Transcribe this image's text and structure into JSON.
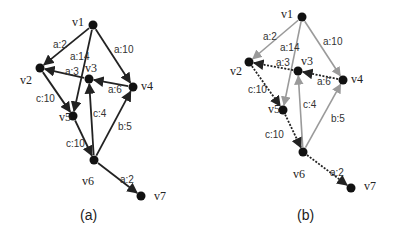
{
  "panels": [
    {
      "caption": "(a)",
      "nodes": [
        {
          "id": "v1",
          "x": 93,
          "y": 25,
          "lx": 72,
          "ly": 26
        },
        {
          "id": "v2",
          "x": 40,
          "y": 68,
          "lx": 20,
          "ly": 84
        },
        {
          "id": "v3",
          "x": 89,
          "y": 79,
          "lx": 85,
          "ly": 72
        },
        {
          "id": "v4",
          "x": 133,
          "y": 87,
          "lx": 141,
          "ly": 90
        },
        {
          "id": "v5",
          "x": 73,
          "y": 116,
          "lx": 59,
          "ly": 121
        },
        {
          "id": "v6",
          "x": 94,
          "y": 160,
          "lx": 82,
          "ly": 185
        },
        {
          "id": "v7",
          "x": 141,
          "y": 196,
          "lx": 154,
          "ly": 200
        }
      ],
      "edges": [
        {
          "from": "v1",
          "to": "v2",
          "label": "a:2",
          "lx": 53,
          "ly": 48,
          "style": "solid"
        },
        {
          "from": "v1",
          "to": "v5",
          "label": "a:14",
          "lx": 70,
          "ly": 60,
          "style": "solid"
        },
        {
          "from": "v1",
          "to": "v4",
          "label": "a:10",
          "lx": 114,
          "ly": 53,
          "style": "solid"
        },
        {
          "from": "v3",
          "to": "v2",
          "label": "a:3",
          "lx": 65,
          "ly": 75,
          "style": "solid"
        },
        {
          "from": "v4",
          "to": "v3",
          "label": "a:6",
          "lx": 108,
          "ly": 93,
          "style": "solid"
        },
        {
          "from": "v2",
          "to": "v5",
          "label": "c:10",
          "lx": 36,
          "ly": 102,
          "style": "solid"
        },
        {
          "from": "v6",
          "to": "v3",
          "label": "c:4",
          "lx": 93,
          "ly": 117,
          "style": "solid"
        },
        {
          "from": "v6",
          "to": "v4",
          "label": "b:5",
          "lx": 118,
          "ly": 130,
          "style": "solid"
        },
        {
          "from": "v5",
          "to": "v6",
          "label": "c:10",
          "lx": 66,
          "ly": 147,
          "style": "solid"
        },
        {
          "from": "v6",
          "to": "v7",
          "label": "a:2",
          "lx": 120,
          "ly": 183,
          "style": "solid"
        }
      ]
    },
    {
      "caption": "(b)",
      "nodes": [
        {
          "id": "v1",
          "x": 302,
          "y": 17,
          "lx": 281,
          "ly": 18
        },
        {
          "id": "v2",
          "x": 249,
          "y": 62,
          "lx": 230,
          "ly": 75
        },
        {
          "id": "v3",
          "x": 298,
          "y": 71,
          "lx": 301,
          "ly": 65
        },
        {
          "id": "v4",
          "x": 343,
          "y": 80,
          "lx": 351,
          "ly": 83
        },
        {
          "id": "v5",
          "x": 283,
          "y": 110,
          "lx": 268,
          "ly": 113
        },
        {
          "id": "v6",
          "x": 303,
          "y": 152,
          "lx": 293,
          "ly": 178
        },
        {
          "id": "v7",
          "x": 351,
          "y": 188,
          "lx": 364,
          "ly": 190
        }
      ],
      "edges": [
        {
          "from": "v1",
          "to": "v2",
          "label": "a:2",
          "lx": 263,
          "ly": 40,
          "style": "gray"
        },
        {
          "from": "v1",
          "to": "v5",
          "label": "a:14",
          "lx": 280,
          "ly": 51,
          "style": "gray"
        },
        {
          "from": "v1",
          "to": "v4",
          "label": "a:10",
          "lx": 323,
          "ly": 45,
          "style": "gray"
        },
        {
          "from": "v3",
          "to": "v2",
          "label": "a:3",
          "lx": 276,
          "ly": 66,
          "style": "dotted"
        },
        {
          "from": "v4",
          "to": "v3",
          "label": "a:6",
          "lx": 317,
          "ly": 85,
          "style": "dotted"
        },
        {
          "from": "v2",
          "to": "v5",
          "label": "c:10",
          "lx": 248,
          "ly": 93,
          "style": "dotted"
        },
        {
          "from": "v6",
          "to": "v3",
          "label": "c:4",
          "lx": 303,
          "ly": 108,
          "style": "gray"
        },
        {
          "from": "v6",
          "to": "v4",
          "label": "b:5",
          "lx": 331,
          "ly": 122,
          "style": "gray"
        },
        {
          "from": "v5",
          "to": "v6",
          "label": "c:10",
          "lx": 265,
          "ly": 138,
          "style": "dotted"
        },
        {
          "from": "v6",
          "to": "v7",
          "label": "a:2",
          "lx": 330,
          "ly": 176,
          "style": "dotted"
        }
      ]
    }
  ],
  "captions": {
    "a": "(a)",
    "b": "(b)"
  },
  "caption_positions": {
    "a": {
      "x": 80,
      "y": 216
    },
    "b": {
      "x": 297,
      "y": 216
    }
  },
  "colors": {
    "solid": "#222222",
    "gray": "#9a9a9a",
    "dotted": "#222222",
    "node": "#111111"
  }
}
